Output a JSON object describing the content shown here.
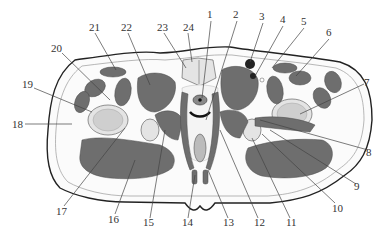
{
  "figure": {
    "type": "anatomical cross-section",
    "labels": [
      {
        "id": "1",
        "text": "1",
        "x": 211,
        "y": 18
      },
      {
        "id": "2",
        "text": "2",
        "x": 237,
        "y": 18
      },
      {
        "id": "3",
        "text": "3",
        "x": 263,
        "y": 20
      },
      {
        "id": "4",
        "text": "4",
        "x": 283,
        "y": 23
      },
      {
        "id": "5",
        "text": "5",
        "x": 304,
        "y": 25
      },
      {
        "id": "6",
        "text": "6",
        "x": 329,
        "y": 36
      },
      {
        "id": "7",
        "text": "7",
        "x": 366,
        "y": 84
      },
      {
        "id": "8",
        "text": "8",
        "x": 370,
        "y": 152
      },
      {
        "id": "9",
        "text": "9",
        "x": 358,
        "y": 186
      },
      {
        "id": "10",
        "text": "10",
        "x": 337,
        "y": 208
      },
      {
        "id": "11",
        "text": "11",
        "x": 292,
        "y": 224
      },
      {
        "id": "12",
        "text": "12",
        "x": 259,
        "y": 224
      },
      {
        "id": "13",
        "text": "13",
        "x": 228,
        "y": 224
      },
      {
        "id": "14",
        "text": "14",
        "x": 187,
        "y": 224
      },
      {
        "id": "15",
        "text": "15",
        "x": 148,
        "y": 224
      },
      {
        "id": "16",
        "text": "16",
        "x": 112,
        "y": 221
      },
      {
        "id": "17",
        "text": "17",
        "x": 60,
        "y": 213
      },
      {
        "id": "18",
        "text": "18",
        "x": 12,
        "y": 126
      },
      {
        "id": "19",
        "text": "19",
        "x": 22,
        "y": 86
      },
      {
        "id": "20",
        "text": "20",
        "x": 50,
        "y": 50
      },
      {
        "id": "21",
        "text": "21",
        "x": 89,
        "y": 30
      },
      {
        "id": "22",
        "text": "22",
        "x": 121,
        "y": 30
      },
      {
        "id": "23",
        "text": "23",
        "x": 157,
        "y": 30
      },
      {
        "id": "24",
        "text": "24",
        "x": 183,
        "y": 30
      }
    ]
  },
  "colors": {
    "muscle": "#6e6e6e",
    "bone": "#e4e4e4",
    "outline": "#222222",
    "label": "#333333"
  }
}
